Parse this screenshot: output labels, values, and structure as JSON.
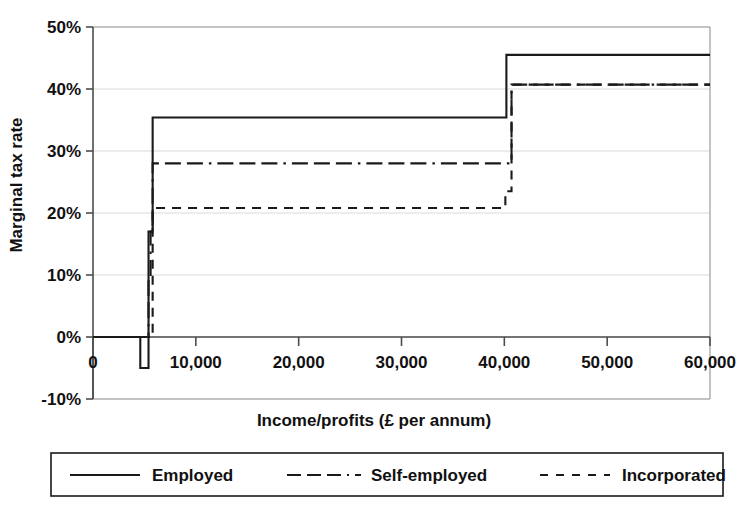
{
  "chart_data": {
    "type": "line",
    "title": "",
    "xlabel": "Income/profits (£ per annum)",
    "ylabel": "Marginal tax rate",
    "xlim": [
      0,
      60000
    ],
    "ylim": [
      -10,
      50
    ],
    "grid": true,
    "legend_position": "bottom",
    "x_ticks": [
      {
        "value": 0,
        "label": "0"
      },
      {
        "value": 10000,
        "label": "10,000"
      },
      {
        "value": 20000,
        "label": "20,000"
      },
      {
        "value": 30000,
        "label": "30,000"
      },
      {
        "value": 40000,
        "label": "40,000"
      },
      {
        "value": 50000,
        "label": "50,000"
      },
      {
        "value": 60000,
        "label": "60,000"
      }
    ],
    "y_ticks": [
      {
        "value": 50,
        "label": "50%"
      },
      {
        "value": 40,
        "label": "40%"
      },
      {
        "value": 30,
        "label": "30%"
      },
      {
        "value": 20,
        "label": "20%"
      },
      {
        "value": 10,
        "label": "10%"
      },
      {
        "value": 0,
        "label": "0%"
      },
      {
        "value": -10,
        "label": "-10%"
      }
    ],
    "series": [
      {
        "name": "Employed",
        "dash": "none",
        "legend_dasharray": "",
        "points": [
          [
            0,
            0
          ],
          [
            4600,
            0
          ],
          [
            4600,
            -5
          ],
          [
            5400,
            -5
          ],
          [
            5400,
            17
          ],
          [
            5800,
            17
          ],
          [
            5800,
            35.4
          ],
          [
            40200,
            35.4
          ],
          [
            40200,
            45.5
          ],
          [
            60000,
            45.5
          ]
        ]
      },
      {
        "name": "Self-employed",
        "dash": "dashdot",
        "legend_dasharray": "14,6,14,6,14,6,2,6",
        "points": [
          [
            0,
            0
          ],
          [
            5400,
            0
          ],
          [
            5400,
            9
          ],
          [
            5600,
            9
          ],
          [
            5600,
            17
          ],
          [
            5800,
            17
          ],
          [
            5800,
            28.0
          ],
          [
            40100,
            28.0
          ],
          [
            40700,
            28.0
          ],
          [
            40700,
            40.7
          ],
          [
            60000,
            40.7
          ]
        ]
      },
      {
        "name": "Incorporated",
        "dash": "dashed",
        "legend_dasharray": "8,8",
        "points": [
          [
            0,
            0
          ],
          [
            5800,
            0
          ],
          [
            5800,
            20.8
          ],
          [
            40100,
            20.8
          ],
          [
            40100,
            23.5
          ],
          [
            40700,
            23.5
          ],
          [
            40700,
            40.7
          ],
          [
            60000,
            40.7
          ]
        ]
      }
    ],
    "annotations": []
  },
  "legend": {
    "entries": [
      {
        "label": "Employed"
      },
      {
        "label": "Self-employed"
      },
      {
        "label": "Incorporated"
      }
    ]
  }
}
